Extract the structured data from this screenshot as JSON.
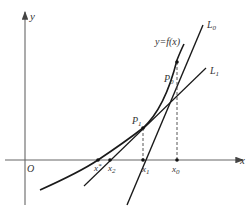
{
  "diagram": {
    "type": "newton-method-tangent-lines",
    "axes": {
      "x_label": "x",
      "y_label": "y",
      "origin_label": "O"
    },
    "curve": {
      "label": "y=f(x)"
    },
    "lines": [
      {
        "id": "L0",
        "label": "L",
        "sub": "0"
      },
      {
        "id": "L1",
        "label": "L",
        "sub": "1"
      }
    ],
    "points": [
      {
        "id": "P0",
        "label": "P",
        "sub": "0"
      },
      {
        "id": "P1",
        "label": "P",
        "sub": "1"
      }
    ],
    "x_ticks": [
      {
        "label": "x",
        "sub": "*"
      },
      {
        "label": "x",
        "sub": "2"
      },
      {
        "label": "x",
        "sub": "1"
      },
      {
        "label": "x",
        "sub": "0"
      }
    ],
    "colors": {
      "stroke": "#1a1a1a",
      "axis": "#555555",
      "text": "#333333"
    }
  }
}
